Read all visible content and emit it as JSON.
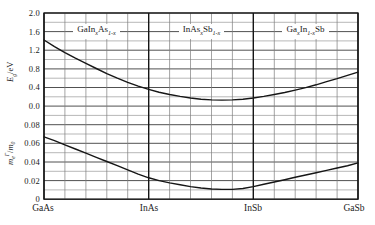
{
  "chart_data": {
    "type": "line",
    "title": "",
    "grid": true,
    "x_axis": {
      "ticks": [
        "GaAs",
        "InAs",
        "InSb",
        "GaSb"
      ],
      "tick_positions": [
        0,
        1,
        2,
        3
      ],
      "range": [
        0,
        3
      ],
      "minor_divisions_per_segment": 5
    },
    "top_panel": {
      "ylabel_parts": {
        "base": "E",
        "sub": "g",
        "rest": "/eV"
      },
      "ylim": [
        0,
        2.0
      ],
      "yticks": [
        "2.0",
        "1.6",
        "1.2",
        "0.8",
        "0.4",
        "0.0"
      ],
      "grid_step": 0.2
    },
    "bottom_panel": {
      "ylabel_parts": {
        "base": "m",
        "sub": "e",
        "sup": "Γ",
        "slash": "/",
        "base2": "m",
        "sub2": "0"
      },
      "ylim": [
        0,
        0.1
      ],
      "yticks": [
        "0.08",
        "0.06",
        "0.04",
        "0.02",
        "0"
      ],
      "grid_step": 0.01
    },
    "region_labels": [
      {
        "A": "GaIn",
        "subA": "x",
        "B": "As",
        "subB": "1-x",
        "C": ""
      },
      {
        "A": "InAs",
        "subA": "x",
        "B": "Sb",
        "subB": "1-x",
        "C": ""
      },
      {
        "A": "Ga",
        "subA": "x",
        "B": "In",
        "subB": "1-x",
        "C": "Sb"
      }
    ],
    "series": [
      {
        "name": "band-gap-Eg-eV",
        "panel": "top",
        "x": [
          0,
          0.1,
          0.2,
          0.3,
          0.4,
          0.5,
          0.6,
          0.7,
          0.8,
          0.9,
          1,
          1.1,
          1.2,
          1.3,
          1.4,
          1.5,
          1.6,
          1.7,
          1.8,
          1.9,
          2,
          2.1,
          2.2,
          2.3,
          2.4,
          2.5,
          2.6,
          2.7,
          2.8,
          2.9,
          3
        ],
        "y": [
          1.42,
          1.28,
          1.15,
          1.03,
          0.92,
          0.81,
          0.7,
          0.6,
          0.51,
          0.43,
          0.36,
          0.3,
          0.25,
          0.21,
          0.175,
          0.15,
          0.135,
          0.13,
          0.135,
          0.15,
          0.175,
          0.21,
          0.25,
          0.295,
          0.345,
          0.4,
          0.46,
          0.525,
          0.59,
          0.66,
          0.73
        ]
      },
      {
        "name": "electron-effective-mass-me-m0",
        "panel": "bottom",
        "x": [
          0,
          0.1,
          0.2,
          0.3,
          0.4,
          0.5,
          0.6,
          0.7,
          0.8,
          0.9,
          1,
          1.1,
          1.2,
          1.3,
          1.4,
          1.5,
          1.6,
          1.7,
          1.8,
          1.9,
          2,
          2.1,
          2.2,
          2.3,
          2.4,
          2.5,
          2.6,
          2.7,
          2.8,
          2.9,
          3
        ],
        "y": [
          0.067,
          0.063,
          0.0585,
          0.054,
          0.0495,
          0.045,
          0.0405,
          0.036,
          0.0315,
          0.027,
          0.023,
          0.02,
          0.0175,
          0.0155,
          0.0135,
          0.012,
          0.011,
          0.0105,
          0.0105,
          0.0115,
          0.0135,
          0.016,
          0.0185,
          0.021,
          0.0235,
          0.026,
          0.0285,
          0.031,
          0.0335,
          0.036,
          0.039
        ]
      }
    ],
    "line_color": "#161616"
  }
}
